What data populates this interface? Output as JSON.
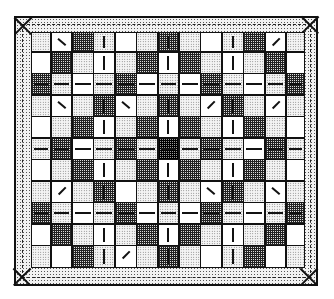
{
  "illustration": {
    "subject": "quilt",
    "border_pattern": "dot",
    "columns": 13,
    "rows": 11,
    "legend": {
      "dot": "stippled fabric",
      "check": "checked fabric",
      "dark": "dark checked fabric",
      "white": "plain fabric"
    },
    "cells": [
      [
        "dot",
        "white:needle",
        "check",
        "dot:v",
        "white",
        "dot",
        "check:v",
        "dot",
        "white",
        "dot:v",
        "check",
        "white:needle-r",
        "dot"
      ],
      [
        "white",
        "check",
        "dot",
        "white:v",
        "dot",
        "check",
        "white:v",
        "check",
        "dot",
        "white:v",
        "dot",
        "check",
        "white"
      ],
      [
        "check:h",
        "dot:h",
        "white:h",
        "dot:h",
        "check:h",
        "white:h",
        "dot:h",
        "white:h",
        "check:h",
        "dot:h",
        "white:h",
        "dot:h",
        "check:h"
      ],
      [
        "dot",
        "white:needle",
        "dot",
        "check:v",
        "white:needle",
        "dot",
        "check:v",
        "dot",
        "white:needle-r",
        "check:v",
        "dot",
        "white:needle-r",
        "dot"
      ],
      [
        "white",
        "dot",
        "check",
        "white:v",
        "dot",
        "check",
        "white:v",
        "check",
        "dot",
        "white:v",
        "check",
        "dot",
        "white"
      ],
      [
        "dot:h",
        "check:h",
        "white:h",
        "dot:h",
        "check:h",
        "dot:h",
        "dark:h",
        "dot:h",
        "check:h",
        "dot:h",
        "white:h",
        "check:h",
        "dot:h"
      ],
      [
        "white",
        "dot",
        "check",
        "white:v",
        "dot",
        "check",
        "white:v",
        "check",
        "dot",
        "white:v",
        "check",
        "dot",
        "white"
      ],
      [
        "dot",
        "white:needle-r",
        "dot",
        "check:v",
        "white",
        "dot",
        "check:v",
        "dot",
        "white:needle",
        "check:v",
        "dot",
        "white:needle",
        "dot"
      ],
      [
        "check:h",
        "dot:h",
        "white:h",
        "dot:h",
        "check:h",
        "white:h",
        "dot:h",
        "white:h",
        "check:h",
        "dot:h",
        "white:h",
        "dot:h",
        "check:h"
      ],
      [
        "white",
        "check",
        "dot",
        "white:v",
        "dot",
        "check",
        "white:v",
        "check",
        "dot",
        "white:v",
        "dot",
        "check",
        "white"
      ],
      [
        "dot",
        "white",
        "check",
        "dot:v",
        "white:needle-r",
        "dot",
        "check:v",
        "dot",
        "white",
        "dot:v",
        "check",
        "white",
        "dot"
      ]
    ]
  }
}
